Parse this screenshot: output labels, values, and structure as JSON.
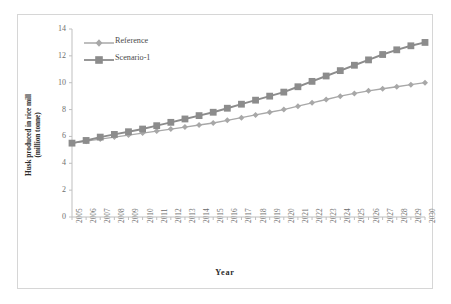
{
  "chart_data": {
    "type": "line",
    "title": "",
    "xlabel": "Year",
    "ylabel": "Husk produced in rice mill (million tonne)",
    "ylabel_line1": "Husk produced in rice mill",
    "ylabel_line2": "(million tonne)",
    "xlim": [
      2005,
      2030
    ],
    "ylim": [
      0,
      14
    ],
    "yticks": [
      0,
      2,
      4,
      6,
      8,
      10,
      12,
      14
    ],
    "grid": false,
    "legend_position": "top-left",
    "x": [
      2005,
      2006,
      2007,
      2008,
      2009,
      2010,
      2011,
      2012,
      2013,
      2014,
      2015,
      2016,
      2017,
      2018,
      2019,
      2020,
      2021,
      2022,
      2023,
      2024,
      2025,
      2026,
      2027,
      2028,
      2029,
      2030
    ],
    "categories": [
      "2005",
      "2006",
      "2007",
      "2008",
      "2009",
      "2010",
      "2011",
      "2012",
      "2013",
      "2014",
      "2015",
      "2016",
      "2017",
      "2018",
      "2019",
      "2020",
      "2021",
      "2022",
      "2023",
      "2024",
      "2025",
      "2026",
      "2027",
      "2028",
      "2029",
      "2030"
    ],
    "series": [
      {
        "name": "Reference",
        "color": "#a8a8a8",
        "marker": "diamond",
        "values": [
          5.5,
          5.65,
          5.8,
          5.95,
          6.1,
          6.25,
          6.4,
          6.55,
          6.7,
          6.85,
          7.0,
          7.2,
          7.4,
          7.6,
          7.8,
          8.0,
          8.25,
          8.5,
          8.75,
          9.0,
          9.2,
          9.4,
          9.55,
          9.7,
          9.85,
          10.0
        ]
      },
      {
        "name": "Scenario-1",
        "color": "#8c8c8c",
        "marker": "square",
        "values": [
          5.5,
          5.7,
          5.95,
          6.15,
          6.35,
          6.55,
          6.8,
          7.05,
          7.3,
          7.55,
          7.8,
          8.1,
          8.4,
          8.7,
          9.0,
          9.3,
          9.7,
          10.1,
          10.5,
          10.9,
          11.3,
          11.7,
          12.1,
          12.45,
          12.75,
          13.0
        ]
      }
    ]
  },
  "legend": {
    "items": [
      {
        "label": "Reference"
      },
      {
        "label": "Scenario-1"
      }
    ]
  },
  "axes": {
    "axis_color": "#bfbfbf",
    "tick_color": "#6e6e6e"
  }
}
